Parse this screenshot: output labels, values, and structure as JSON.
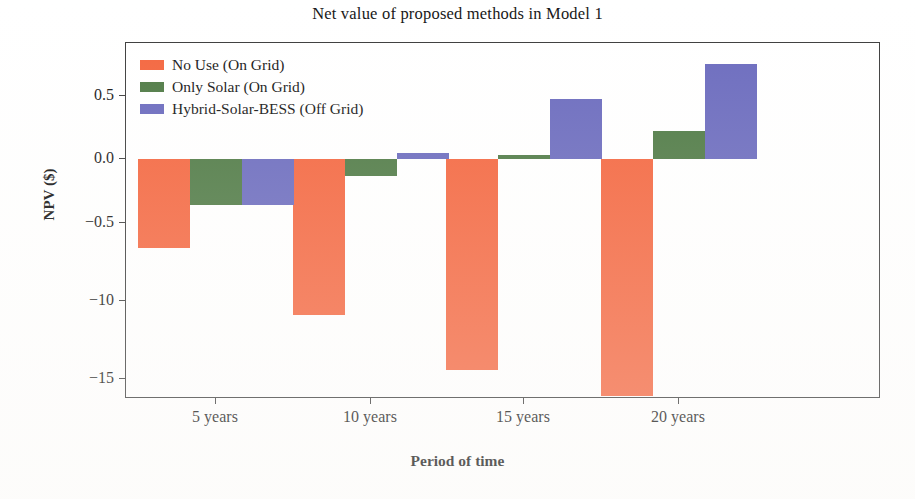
{
  "chart_data": {
    "type": "bar",
    "title": "Net value of proposed methods in Model 1",
    "xlabel": "Period of time",
    "ylabel": "NPV ($)",
    "categories": [
      "5 years",
      "10 years",
      "15 years",
      "20 years"
    ],
    "series": [
      {
        "name": "No Use (On Grid)",
        "color": "#F4663F",
        "values": [
          -0.7,
          -1.23,
          -1.66,
          -1.87
        ]
      },
      {
        "name": "Only Solar (On Grid)",
        "color": "#4F7A45",
        "values": [
          -0.36,
          -0.13,
          0.03,
          0.22
        ]
      },
      {
        "name": "Hybrid-Solar-BESS (Off Grid)",
        "color": "#6B6BBE",
        "values": [
          -0.36,
          0.05,
          0.47,
          0.75
        ]
      }
    ],
    "ytick_labels": [
      "0.5",
      "0.0",
      "−0.5",
      "−10",
      "−15"
    ],
    "ytick_values": [
      0.5,
      0.0,
      -0.5,
      -1.0,
      -1.5
    ],
    "ylim": [
      -1.84,
      0.88
    ],
    "grid": false,
    "legend_position": "upper left",
    "legend": [
      "No Use (On Grid)",
      "Only Solar (On Grid)",
      "Hybrid-Solar-BESS (Off Grid)"
    ]
  },
  "axes": {
    "y_title": "NPV ($)",
    "x_title": "Period of time"
  }
}
